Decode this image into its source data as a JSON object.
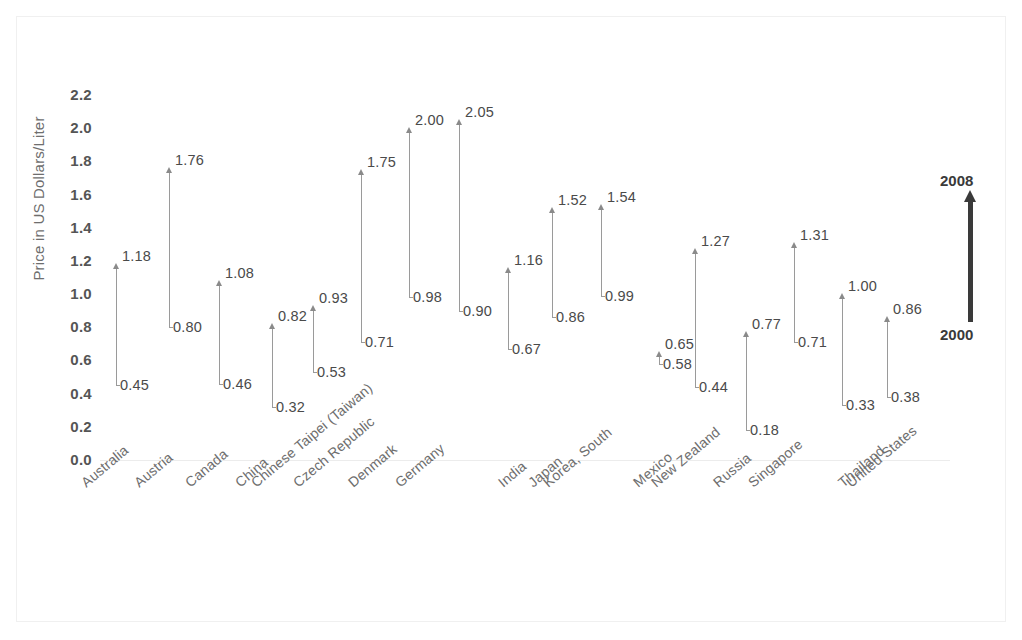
{
  "chart_data": {
    "type": "bar",
    "title": "",
    "subtitle": "",
    "xlabel": "",
    "ylabel": "Price in US Dollars/Liter",
    "ylim": [
      0.0,
      2.2
    ],
    "ytick_step": 0.2,
    "yticks": [
      "2.2",
      "2.0",
      "1.8",
      "1.6",
      "1.4",
      "1.2",
      "1.0",
      "0.8",
      "0.6",
      "0.4",
      "0.2",
      "0.0"
    ],
    "grid": false,
    "legend_position": "right",
    "legend": {
      "top_label": "2008",
      "bottom_label": "2000",
      "arrow_color": "#3a3a3a"
    },
    "series": [
      {
        "name": "2000",
        "values": [
          0.45,
          0.8,
          0.46,
          0.32,
          0.53,
          0.71,
          0.98,
          0.9,
          0.67,
          0.86,
          0.99,
          0.58,
          0.44,
          0.18,
          0.71,
          0.33,
          0.38
        ]
      },
      {
        "name": "2008",
        "values": [
          1.18,
          1.76,
          1.08,
          0.82,
          0.93,
          1.75,
          2.0,
          2.05,
          1.16,
          1.52,
          1.54,
          0.65,
          1.27,
          0.77,
          1.31,
          1.0,
          0.86
        ]
      }
    ],
    "categories": [
      "Australia",
      "Austria",
      "Canada",
      "China",
      "Chinese Taipei (Taiwan)",
      "Czech Republic",
      "Denmark",
      "Germany",
      "India",
      "Japan",
      "Korea, South",
      "Mexico",
      "New Zealand",
      "Russia",
      "Singapore",
      "Thailand",
      "United States"
    ],
    "points": [
      {
        "category": "Australia",
        "start": "0.45",
        "end": "1.18",
        "x": 116
      },
      {
        "category": "Austria",
        "start": "0.80",
        "end": "1.76",
        "x": 169
      },
      {
        "category": "Canada",
        "start": "0.46",
        "end": "1.08",
        "x": 219
      },
      {
        "category": "China",
        "start": "0.32",
        "end": "0.82",
        "x": 272
      },
      {
        "category": "Chinese Taipei (Taiwan)",
        "start": "0.53",
        "end": "0.93",
        "x": 313
      },
      {
        "category": "Czech Republic",
        "start": "0.71",
        "end": "1.75",
        "x": 361
      },
      {
        "category": "Denmark",
        "start": "0.98",
        "end": "2.00",
        "x": 409
      },
      {
        "category": "Germany",
        "start": "0.90",
        "end": "2.05",
        "x": 459
      },
      {
        "category": "India",
        "start": "0.67",
        "end": "1.16",
        "x": 508
      },
      {
        "category": "Japan",
        "start": "0.86",
        "end": "1.52",
        "x": 552
      },
      {
        "category": "Korea, South",
        "start": "0.99",
        "end": "1.54",
        "x": 601
      },
      {
        "category": "Mexico",
        "start": "0.58",
        "end": "0.65",
        "x": 659
      },
      {
        "category": "New Zealand",
        "start": "0.44",
        "end": "1.27",
        "x": 695
      },
      {
        "category": "Russia",
        "start": "0.18",
        "end": "0.77",
        "x": 746
      },
      {
        "category": "Singapore",
        "start": "0.71",
        "end": "1.31",
        "x": 794
      },
      {
        "category": "Thailand",
        "start": "0.33",
        "end": "1.00",
        "x": 842
      },
      {
        "category": "United States",
        "start": "0.38",
        "end": "0.86",
        "x": 887
      }
    ],
    "xtick_positions": [
      78,
      131,
      182,
      232,
      248,
      290,
      345,
      392,
      495,
      525,
      540,
      630,
      648,
      710,
      745,
      835,
      843
    ]
  }
}
